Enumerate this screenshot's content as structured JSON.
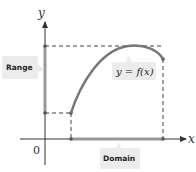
{
  "diagram": {
    "type": "function-domain-range",
    "axes": {
      "x_label": "x",
      "y_label": "y",
      "origin_label": "0"
    },
    "labels": {
      "range": "Range",
      "domain": "Domain",
      "function": "y = f(x)"
    },
    "colors": {
      "curve": "#777777",
      "domain_range_bar": "#999999",
      "axis": "#333333",
      "dash": "#444444",
      "label_box": "#ececec"
    }
  }
}
